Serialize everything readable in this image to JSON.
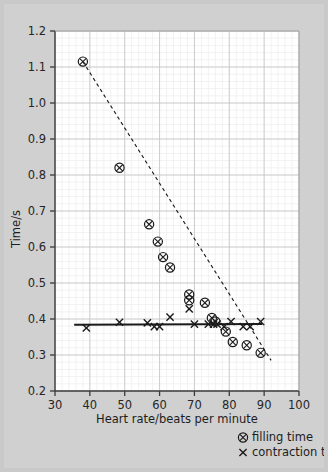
{
  "chart_data": {
    "type": "scatter",
    "title": "",
    "xlabel": "Heart rate/beats per minute",
    "ylabel": "Time/s",
    "xlim": [
      30,
      100
    ],
    "ylim": [
      0.2,
      1.2
    ],
    "xticks": [
      30,
      40,
      50,
      60,
      70,
      80,
      90,
      100
    ],
    "yticks": [
      "1.2",
      "1.1",
      "1.0",
      "0.9",
      "0.8",
      "0.7",
      "0.6",
      "0.5",
      "0.4",
      "0.3",
      "0.2"
    ],
    "xtick_step": 10,
    "ytick_step": 0.1,
    "grid": true,
    "minor_grid": true,
    "minor_divisions": 5,
    "legend_position": "below-right",
    "series": [
      {
        "name": "filling time",
        "marker": "circle-cross",
        "line": "dashed",
        "points": [
          [
            38.0,
            1.115
          ],
          [
            48.5,
            0.82
          ],
          [
            57.0,
            0.663
          ],
          [
            59.5,
            0.615
          ],
          [
            61.0,
            0.572
          ],
          [
            63.0,
            0.543
          ],
          [
            68.5,
            0.468
          ],
          [
            68.5,
            0.452
          ],
          [
            73.0,
            0.445
          ],
          [
            75.0,
            0.403
          ],
          [
            76.0,
            0.393
          ],
          [
            79.0,
            0.365
          ],
          [
            81.0,
            0.336
          ],
          [
            85.0,
            0.327
          ],
          [
            89.0,
            0.306
          ]
        ],
        "trend_start": [
          38.0,
          1.115
        ],
        "trend_end": [
          92.0,
          0.285
        ]
      },
      {
        "name": "contraction time",
        "marker": "cross",
        "line": "solid",
        "points": [
          [
            39.0,
            0.375
          ],
          [
            48.5,
            0.391
          ],
          [
            56.5,
            0.389
          ],
          [
            58.5,
            0.379
          ],
          [
            60.0,
            0.379
          ],
          [
            63.0,
            0.405
          ],
          [
            68.5,
            0.428
          ],
          [
            70.0,
            0.386
          ],
          [
            74.0,
            0.386
          ],
          [
            75.5,
            0.386
          ],
          [
            76.5,
            0.386
          ],
          [
            78.5,
            0.379
          ],
          [
            80.5,
            0.393
          ],
          [
            84.0,
            0.379
          ],
          [
            86.0,
            0.379
          ],
          [
            89.0,
            0.393
          ]
        ],
        "trend_start": [
          35.5,
          0.384
        ],
        "trend_end": [
          89.5,
          0.386
        ]
      }
    ]
  },
  "legend": {
    "items": [
      {
        "symbol": "circle-cross",
        "label": "filling time"
      },
      {
        "symbol": "cross",
        "label": "contraction time"
      }
    ]
  },
  "colors": {
    "background": "#d0d0d0",
    "plot_background": "#ffffff",
    "marker": "#1a1a1a",
    "grid_major": "#c8c8c8",
    "grid_minor": "#ececec",
    "axis": "#3a3a3a"
  }
}
